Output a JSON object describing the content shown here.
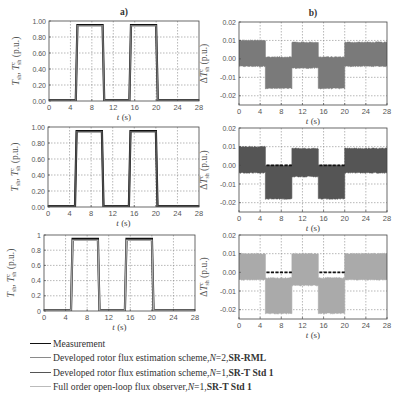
{
  "chart_data": [
    {
      "id": "a1",
      "panel": "a)",
      "type": "line",
      "title": "a)",
      "xlabel": "t (s)",
      "ylabel": "T_sh, T^c_sh (p.u.)",
      "xlim": [
        0,
        28
      ],
      "ylim": [
        0,
        1
      ],
      "xticks": [
        0,
        4,
        8,
        12,
        16,
        20,
        24,
        28
      ],
      "yticks": [
        0,
        0.2,
        0.4,
        0.6,
        0.8,
        1.0
      ],
      "ytick_labels": [
        "0.00",
        "0.20",
        "0.40",
        "0.60",
        "0.80",
        "1.00"
      ],
      "grid": true,
      "series": [
        {
          "name": "Measurement",
          "color": "#111111",
          "x": [
            0,
            5,
            5.3,
            10,
            10.3,
            15,
            15.3,
            20,
            20.3,
            28
          ],
          "values": [
            0.01,
            0.01,
            0.95,
            0.95,
            0.01,
            0.01,
            0.95,
            0.95,
            0.01,
            0.01
          ]
        },
        {
          "name": "Developed rotor flux estimation scheme, N=2, SR-RML",
          "color": "#7a7a7a",
          "x": [
            0,
            5,
            5.3,
            10,
            10.3,
            15,
            15.3,
            20,
            20.3,
            28
          ],
          "values": [
            0.01,
            0.01,
            0.94,
            0.94,
            0.01,
            0.01,
            0.94,
            0.94,
            0.01,
            0.01
          ]
        }
      ]
    },
    {
      "id": "b1",
      "panel": "b)",
      "type": "line",
      "title": "b)",
      "xlabel": "t (s)",
      "ylabel": "ΔT^c_sh (p.u.)",
      "xlim": [
        0,
        28
      ],
      "ylim": [
        -0.025,
        0.02
      ],
      "xticks": [
        0,
        4,
        8,
        12,
        16,
        20,
        24,
        28
      ],
      "yticks": [
        -0.02,
        -0.01,
        0.0,
        0.01,
        0.02
      ],
      "ytick_labels": [
        "-0.02",
        "-0.01",
        "0.00",
        "0.01",
        "0.02"
      ],
      "grid": true,
      "series": [
        {
          "name": "Developed rotor flux estimation scheme, N=2, SR-RML",
          "color": "#7a7a7a",
          "segments": [
            {
              "x0": 0,
              "x1": 5,
              "upper": 0.01,
              "lower": -0.004
            },
            {
              "x0": 5,
              "x1": 10,
              "upper": 0.001,
              "lower": -0.016
            },
            {
              "x0": 10,
              "x1": 15,
              "upper": 0.009,
              "lower": -0.005
            },
            {
              "x0": 15,
              "x1": 20,
              "upper": 0.001,
              "lower": -0.016
            },
            {
              "x0": 20,
              "x1": 28,
              "upper": 0.009,
              "lower": -0.004
            }
          ]
        }
      ]
    },
    {
      "id": "a2",
      "panel": "a)",
      "type": "line",
      "xlabel": "t (s)",
      "ylabel": "T_sh, T^c_sh (p.u.)",
      "xlim": [
        0,
        28
      ],
      "ylim": [
        0,
        1
      ],
      "xticks": [
        0,
        4,
        8,
        12,
        16,
        20,
        24,
        28
      ],
      "yticks": [
        0,
        0.2,
        0.4,
        0.6,
        0.8,
        1.0
      ],
      "ytick_labels": [
        "0.00",
        "0.20",
        "0.40",
        "0.60",
        "0.80",
        "1.00"
      ],
      "grid": true,
      "series": [
        {
          "name": "Measurement",
          "color": "#111111",
          "x": [
            0,
            5,
            5.3,
            10,
            10.3,
            15,
            15.3,
            20,
            20.3,
            28
          ],
          "values": [
            0.01,
            0.01,
            0.95,
            0.95,
            0.01,
            0.01,
            0.95,
            0.95,
            0.01,
            0.01
          ]
        },
        {
          "name": "Developed rotor flux estimation scheme, N=1, SR-T Std 1",
          "color": "#555555",
          "x": [
            0,
            5,
            5.3,
            10,
            10.3,
            15,
            15.3,
            20,
            20.3,
            28
          ],
          "values": [
            0.01,
            0.01,
            0.94,
            0.94,
            0.01,
            0.01,
            0.94,
            0.94,
            0.01,
            0.01
          ]
        }
      ]
    },
    {
      "id": "b2",
      "panel": "b)",
      "type": "line",
      "xlabel": "t (s)",
      "ylabel": "ΔT^c_sh (p.u.)",
      "xlim": [
        0,
        28
      ],
      "ylim": [
        -0.025,
        0.02
      ],
      "xticks": [
        0,
        4,
        8,
        12,
        16,
        20,
        24,
        28
      ],
      "yticks": [
        -0.02,
        -0.01,
        0.0,
        0.01,
        0.02
      ],
      "ytick_labels": [
        "-0.02",
        "-0.01",
        "0.00",
        "0.01",
        "0.02"
      ],
      "grid": true,
      "series": [
        {
          "name": "Developed rotor flux estimation scheme, N=1, SR-T Std 1",
          "color": "#555555",
          "segments": [
            {
              "x0": 0,
              "x1": 5,
              "upper": 0.01,
              "lower": -0.004
            },
            {
              "x0": 5,
              "x1": 10,
              "upper": 0.0,
              "lower": -0.018
            },
            {
              "x0": 10,
              "x1": 15,
              "upper": 0.009,
              "lower": -0.006
            },
            {
              "x0": 15,
              "x1": 20,
              "upper": 0.0,
              "lower": -0.018
            },
            {
              "x0": 20,
              "x1": 28,
              "upper": 0.009,
              "lower": -0.004
            }
          ]
        },
        {
          "name": "Measurement reference (zero)",
          "color": "#111111",
          "style": "dashed",
          "x": [
            5.2,
            10,
            15.2,
            20
          ],
          "values": [
            0,
            0,
            0,
            0
          ]
        }
      ]
    },
    {
      "id": "a3",
      "panel": "a)",
      "type": "line",
      "xlabel": "t (s)",
      "ylabel": "T_sh, T^c_sh (p.u.)",
      "xlim": [
        0,
        28
      ],
      "ylim": [
        0,
        1
      ],
      "xticks": [
        0,
        4,
        8,
        12,
        16,
        20,
        24,
        28
      ],
      "yticks": [
        0,
        0.2,
        0.4,
        0.6,
        0.8,
        1.0
      ],
      "ytick_labels": [
        "0",
        "0.2",
        "0.4",
        "0.6",
        "0.8",
        "1"
      ],
      "grid": true,
      "series": [
        {
          "name": "Measurement",
          "color": "#111111",
          "x": [
            0,
            5,
            5.3,
            10,
            10.3,
            15,
            15.3,
            20,
            20.3,
            28
          ],
          "values": [
            0.01,
            0.01,
            0.95,
            0.95,
            0.01,
            0.01,
            0.95,
            0.95,
            0.01,
            0.01
          ]
        },
        {
          "name": "Full order open-loop flux observer, N=1, SR-T Std 1",
          "color": "#aaaaaa",
          "x": [
            0,
            5,
            5.3,
            10,
            10.3,
            15,
            15.3,
            20,
            20.3,
            28
          ],
          "values": [
            0.01,
            0.01,
            0.93,
            0.93,
            0.01,
            0.01,
            0.93,
            0.93,
            0.01,
            0.01
          ]
        }
      ]
    },
    {
      "id": "b3",
      "panel": "b)",
      "type": "line",
      "xlabel": "t (s)",
      "ylabel": "ΔT^c_sh (p.u.)",
      "xlim": [
        0,
        28
      ],
      "ylim": [
        -0.025,
        0.02
      ],
      "xticks": [
        0,
        4,
        8,
        12,
        16,
        20,
        24,
        28
      ],
      "yticks": [
        -0.02,
        -0.01,
        0.0,
        0.01,
        0.02
      ],
      "ytick_labels": [
        "-0.02",
        "-0.01",
        "0.00",
        "0.01",
        "0.02"
      ],
      "grid": true,
      "series": [
        {
          "name": "Full order open-loop flux observer, N=1, SR-T Std 1",
          "color": "#aaaaaa",
          "segments": [
            {
              "x0": 0,
              "x1": 5,
              "upper": 0.01,
              "lower": -0.004
            },
            {
              "x0": 5,
              "x1": 10,
              "upper": -0.003,
              "lower": -0.022
            },
            {
              "x0": 10,
              "x1": 15,
              "upper": 0.01,
              "lower": -0.007
            },
            {
              "x0": 15,
              "x1": 20,
              "upper": -0.003,
              "lower": -0.022
            },
            {
              "x0": 20,
              "x1": 28,
              "upper": 0.01,
              "lower": -0.004
            }
          ]
        },
        {
          "name": "Measurement reference (zero)",
          "color": "#111111",
          "style": "dashed",
          "x": [
            5.2,
            10,
            15.2,
            20
          ],
          "values": [
            0,
            0,
            0,
            0
          ]
        }
      ]
    }
  ],
  "layout": {
    "panels": {
      "a1": {
        "left": 49,
        "top": 21,
        "width": 150,
        "height": 80
      },
      "b1": {
        "left": 239,
        "top": 22,
        "width": 148,
        "height": 83
      },
      "a2": {
        "left": 48,
        "top": 127,
        "width": 151,
        "height": 80
      },
      "b2": {
        "left": 239,
        "top": 128,
        "width": 148,
        "height": 84
      },
      "a3": {
        "left": 44,
        "top": 235,
        "width": 151,
        "height": 76
      },
      "b3": {
        "left": 239,
        "top": 235,
        "width": 148,
        "height": 84
      }
    }
  },
  "labels": {
    "panel_a": "a)",
    "panel_b": "b)",
    "xlabel": "t (s)",
    "ylabel_a": "T",
    "ylabel_b": "ΔT",
    "pu": "(p.u.)"
  },
  "legend": {
    "items": [
      {
        "color": "#111111",
        "text": "Measurement",
        "bold": ""
      },
      {
        "color": "#8a8a8a",
        "text": "Developed rotor flux estimation scheme, ",
        "italic": "N",
        "eq": "=2, ",
        "bold": "SR-RML"
      },
      {
        "color": "#555555",
        "text": "Developed rotor flux estimation scheme, ",
        "italic": "N",
        "eq": "=1, ",
        "bold": "SR-T Std 1"
      },
      {
        "color": "#bbbbbb",
        "text": "Full order open-loop flux observer, ",
        "italic": "N",
        "eq": "=1, ",
        "bold": "SR-T Std 1"
      }
    ]
  }
}
